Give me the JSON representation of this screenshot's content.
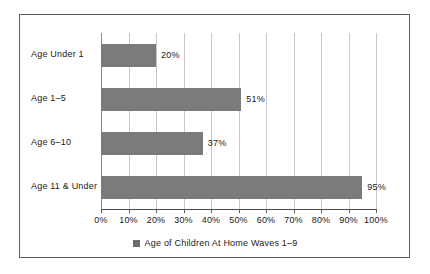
{
  "chart_data": {
    "type": "bar",
    "orientation": "horizontal",
    "title": "",
    "subtitle": "",
    "xlabel": "",
    "ylabel": "",
    "categories": [
      "Age Under 1",
      "Age 1–5",
      "Age 6–10",
      "Age 11 & Under"
    ],
    "values": [
      20,
      51,
      37,
      95
    ],
    "value_labels": [
      "20%",
      "51%",
      "37%",
      "95%"
    ],
    "xlim": [
      0,
      100
    ],
    "xticks": [
      0,
      10,
      20,
      30,
      40,
      50,
      60,
      70,
      80,
      90,
      100
    ],
    "xtick_labels": [
      "0%",
      "10%",
      "20%",
      "30%",
      "40%",
      "50%",
      "60%",
      "70%",
      "80%",
      "90%",
      "100%"
    ],
    "grid": true,
    "grid_axis": "x",
    "legend": {
      "position": "bottom",
      "entries": [
        {
          "label": "Age of Children At Home Waves 1–9",
          "marker": "square",
          "color": "#6d6d6d"
        }
      ]
    },
    "series": [
      {
        "name": "Age of Children At Home Waves 1–9",
        "color": "#7b7b7b",
        "values": [
          20,
          51,
          37,
          95
        ]
      }
    ],
    "colors": {
      "bar_fill": "#7b7b7b",
      "gridline": "#c8c8c8",
      "axis": "#4a4a4a",
      "frame": "#5d5d5d",
      "text": "#1a1a1a",
      "background": "#ffffff"
    }
  }
}
